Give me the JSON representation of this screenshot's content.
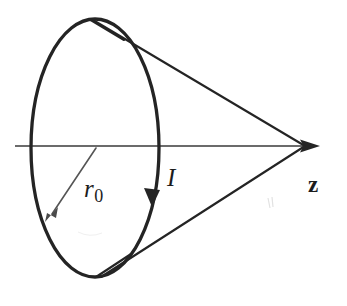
{
  "figure": {
    "kind": "physics-diagram",
    "background_color": "#ffffff",
    "ink_color": "#242424",
    "thin_ink_color": "#3a3a3a",
    "labels": {
      "radius": "r",
      "radius_subscript": "0",
      "current": "I",
      "axis": "z"
    },
    "geometry": {
      "loop": {
        "center_x": 95,
        "center_y": 148,
        "radius_x": 64,
        "radius_y": 130,
        "stroke_width": 3.2
      },
      "axis_line": {
        "x1": 15,
        "y1": 146,
        "x2": 318,
        "y2": 146,
        "stroke_width": 1.4
      },
      "apex": {
        "x": 304,
        "y": 146
      },
      "cone_upper": {
        "x1": 93,
        "y1": 20,
        "x2": 304,
        "y2": 146
      },
      "cone_lower": {
        "x1": 100,
        "y1": 276,
        "x2": 304,
        "y2": 146
      },
      "radius_arrow": {
        "x1": 95,
        "y1": 148,
        "x2": 48,
        "y2": 219
      },
      "current_arrow_tip": {
        "x": 152,
        "y": 203
      }
    }
  }
}
